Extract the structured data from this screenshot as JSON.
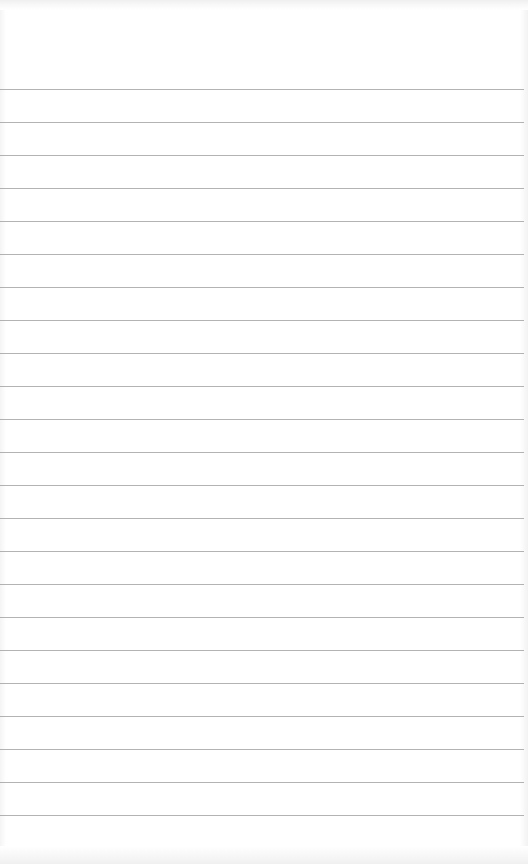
{
  "notepad": {
    "paper_color": "#ffffff",
    "rule_color": "#9a9a9a",
    "first_rule_y": 89,
    "rule_spacing": 33,
    "rule_count": 24,
    "text": ""
  }
}
